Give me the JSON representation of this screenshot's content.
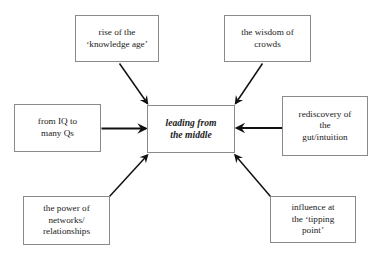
{
  "diagram": {
    "type": "hub-and-spoke concept diagram",
    "center": {
      "id": "center",
      "label": "leading from\nthe middle",
      "style": "bold italic"
    },
    "nodes": [
      {
        "id": "top-left",
        "label": "rise of the\n‘knowledge age’"
      },
      {
        "id": "top-right",
        "label": "the wisdom of\ncrowds"
      },
      {
        "id": "left",
        "label": "from IQ to\nmany Qs"
      },
      {
        "id": "right",
        "label": "rediscovery of\nthe\ngut/intuition"
      },
      {
        "id": "bottom-left",
        "label": "the power of\nnetworks/\nrelationships"
      },
      {
        "id": "bottom-right",
        "label": "influence at\nthe ‘tipping\npoint’"
      }
    ],
    "arrows": [
      {
        "id": "arrow-top-left-to-center",
        "from": "top-left",
        "to": "center",
        "direction": "down-right"
      },
      {
        "id": "arrow-top-right-to-center",
        "from": "top-right",
        "to": "center",
        "direction": "down-left"
      },
      {
        "id": "arrow-left-to-center",
        "from": "left",
        "to": "center",
        "direction": "right"
      },
      {
        "id": "arrow-right-to-center",
        "from": "right",
        "to": "center",
        "direction": "left"
      },
      {
        "id": "arrow-bottom-left-to-center",
        "from": "bottom-left",
        "to": "center",
        "direction": "up-right"
      },
      {
        "id": "arrow-bottom-right-to-center",
        "from": "bottom-right",
        "to": "center",
        "direction": "up-left"
      }
    ],
    "colors": {
      "background": "#ffffff",
      "box_border": "#8a8a8a",
      "arrow": "#111111",
      "text": "#1a1a1a"
    }
  }
}
